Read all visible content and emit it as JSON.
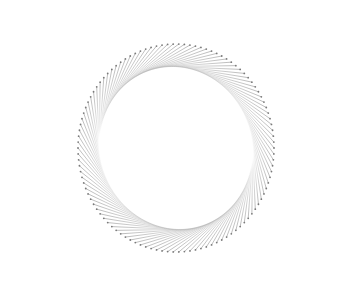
{
  "artwork": {
    "kind": "radial-pin-spiral",
    "center": [
      176,
      148
    ],
    "radius_x": 98,
    "radius_y": 104,
    "count": 110,
    "line_color": "#9a9a9a",
    "dot_color": "#7a7a7a",
    "background": "#ffffff"
  }
}
